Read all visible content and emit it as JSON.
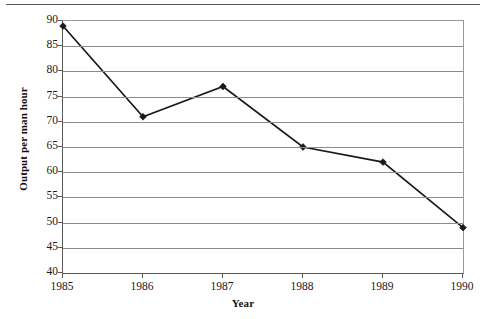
{
  "chart_data": {
    "type": "line",
    "title": "",
    "xlabel": "Year",
    "ylabel": "Output per man hour",
    "categories": [
      "1985",
      "1986",
      "1987",
      "1988",
      "1989",
      "1990"
    ],
    "values": [
      89,
      71,
      77,
      65,
      62,
      49
    ],
    "series": [
      {
        "name": "Output per man hour",
        "values": [
          89,
          71,
          77,
          65,
          62,
          49
        ]
      }
    ],
    "ylim": [
      40,
      90
    ],
    "yticks": [
      40,
      45,
      50,
      55,
      60,
      65,
      70,
      75,
      80,
      85,
      90
    ],
    "ytick_labels": [
      "40",
      "45",
      "50",
      "55",
      "60",
      "65",
      "70",
      "75",
      "80",
      "85",
      "90"
    ],
    "xtick_labels": [
      "1985",
      "1986",
      "1987",
      "1988",
      "1989",
      "1990"
    ],
    "grid": "horizontal",
    "legend": "none",
    "line_color": "#1a1a1a",
    "marker": "diamond",
    "marker_color": "#1a1a1a",
    "gridline_color": "#8c8c8c",
    "axis_color": "#5a5a5a",
    "background_color": "#ffffff"
  }
}
